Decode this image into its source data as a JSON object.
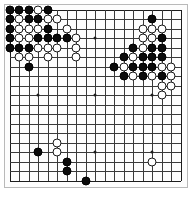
{
  "app": {
    "title": "Go Board Position",
    "board_label": "go-board"
  },
  "board": {
    "size": 19,
    "size_label": "19x19",
    "line_color": "#3a3a3a",
    "edge_color": "#1d1d1d",
    "background_color": "#fdfdfd",
    "frame_color": "#b9b9b9",
    "black_color": "#0b0b0b",
    "white_color": "#fefefe",
    "white_border_color": "#1a1a1a",
    "origin_x": 9.5,
    "origin_y": 9.5,
    "spacing": 9.5,
    "stone_diameter": 9,
    "star_points": [
      [
        4,
        4
      ],
      [
        10,
        4
      ],
      [
        16,
        4
      ],
      [
        4,
        10
      ],
      [
        10,
        10
      ],
      [
        16,
        10
      ],
      [
        4,
        16
      ],
      [
        10,
        16
      ],
      [
        16,
        16
      ]
    ],
    "black_stones": [
      [
        1,
        1
      ],
      [
        2,
        1
      ],
      [
        3,
        1
      ],
      [
        5,
        1
      ],
      [
        1,
        2
      ],
      [
        3,
        2
      ],
      [
        4,
        2
      ],
      [
        1,
        3
      ],
      [
        5,
        3
      ],
      [
        1,
        4
      ],
      [
        4,
        4
      ],
      [
        5,
        4
      ],
      [
        6,
        4
      ],
      [
        7,
        4
      ],
      [
        1,
        5
      ],
      [
        2,
        5
      ],
      [
        3,
        5
      ],
      [
        3,
        7
      ],
      [
        16,
        2
      ],
      [
        17,
        4
      ],
      [
        14,
        5
      ],
      [
        16,
        5
      ],
      [
        17,
        5
      ],
      [
        13,
        6
      ],
      [
        15,
        6
      ],
      [
        16,
        6
      ],
      [
        17,
        6
      ],
      [
        12,
        7
      ],
      [
        14,
        7
      ],
      [
        15,
        7
      ],
      [
        16,
        7
      ],
      [
        13,
        8
      ],
      [
        15,
        8
      ],
      [
        17,
        8
      ],
      [
        4,
        16
      ],
      [
        7,
        17
      ],
      [
        7,
        18
      ],
      [
        9,
        19
      ]
    ],
    "white_stones": [
      [
        4,
        1
      ],
      [
        2,
        2
      ],
      [
        5,
        2
      ],
      [
        6,
        2
      ],
      [
        2,
        3
      ],
      [
        3,
        3
      ],
      [
        4,
        3
      ],
      [
        7,
        3
      ],
      [
        2,
        4
      ],
      [
        3,
        4
      ],
      [
        8,
        4
      ],
      [
        4,
        5
      ],
      [
        5,
        5
      ],
      [
        6,
        5
      ],
      [
        8,
        5
      ],
      [
        2,
        6
      ],
      [
        3,
        6
      ],
      [
        5,
        6
      ],
      [
        8,
        6
      ],
      [
        15,
        3
      ],
      [
        16,
        3
      ],
      [
        17,
        3
      ],
      [
        15,
        4
      ],
      [
        16,
        4
      ],
      [
        15,
        5
      ],
      [
        14,
        6
      ],
      [
        13,
        7
      ],
      [
        17,
        7
      ],
      [
        18,
        7
      ],
      [
        14,
        8
      ],
      [
        16,
        8
      ],
      [
        18,
        8
      ],
      [
        17,
        9
      ],
      [
        18,
        9
      ],
      [
        17,
        10
      ],
      [
        6,
        15
      ],
      [
        6,
        16
      ],
      [
        16,
        17
      ]
    ]
  }
}
